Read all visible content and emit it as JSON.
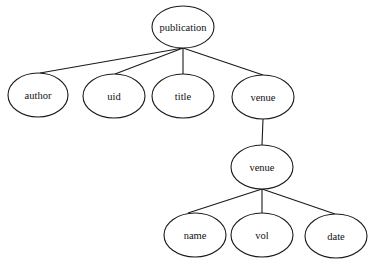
{
  "diagram": {
    "type": "tree",
    "nodes": [
      {
        "id": "publication",
        "label": "publication",
        "cx": 183,
        "cy": 27,
        "rx": 31,
        "ry": 21
      },
      {
        "id": "author",
        "label": "author",
        "cx": 38,
        "cy": 95,
        "rx": 30,
        "ry": 22
      },
      {
        "id": "uid",
        "label": "uid",
        "cx": 114,
        "cy": 96,
        "rx": 31,
        "ry": 22
      },
      {
        "id": "title",
        "label": "title",
        "cx": 183,
        "cy": 96,
        "rx": 31,
        "ry": 22
      },
      {
        "id": "venue1",
        "label": "venue",
        "cx": 263,
        "cy": 97,
        "rx": 31,
        "ry": 22
      },
      {
        "id": "venue2",
        "label": "venue",
        "cx": 262,
        "cy": 167,
        "rx": 31,
        "ry": 22
      },
      {
        "id": "name",
        "label": "name",
        "cx": 195,
        "cy": 235,
        "rx": 31,
        "ry": 22
      },
      {
        "id": "vol",
        "label": "vol",
        "cx": 262,
        "cy": 235,
        "rx": 31,
        "ry": 22
      },
      {
        "id": "date",
        "label": "date",
        "cx": 336,
        "cy": 236,
        "rx": 31,
        "ry": 22
      }
    ],
    "edges": [
      {
        "from": "publication",
        "to": "author",
        "x1": 183,
        "y1": 48,
        "x2": 40,
        "y2": 73
      },
      {
        "from": "publication",
        "to": "uid",
        "x1": 183,
        "y1": 48,
        "x2": 115,
        "y2": 74
      },
      {
        "from": "publication",
        "to": "title",
        "x1": 183,
        "y1": 48,
        "x2": 183,
        "y2": 74
      },
      {
        "from": "publication",
        "to": "venue1",
        "x1": 183,
        "y1": 48,
        "x2": 263,
        "y2": 75
      },
      {
        "from": "venue1",
        "to": "venue2",
        "x1": 263,
        "y1": 119,
        "x2": 262,
        "y2": 145
      },
      {
        "from": "venue2",
        "to": "name",
        "x1": 262,
        "y1": 189,
        "x2": 188,
        "y2": 213
      },
      {
        "from": "venue2",
        "to": "vol",
        "x1": 262,
        "y1": 189,
        "x2": 262,
        "y2": 213
      },
      {
        "from": "venue2",
        "to": "date",
        "x1": 262,
        "y1": 189,
        "x2": 335,
        "y2": 214
      }
    ]
  }
}
